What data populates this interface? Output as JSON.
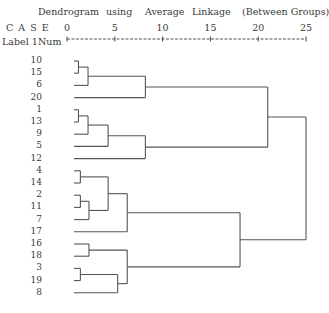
{
  "header": {
    "title_words": [
      "Dendrogram",
      "using",
      "Average",
      "Linkage",
      "(Between Groups)"
    ],
    "case_label": "C A S E",
    "label_col": "Label",
    "num_col": "Num"
  },
  "chart_data": {
    "type": "dendrogram",
    "xlabel": "Rescaled Distance Cluster Combine",
    "axis_ticks": [
      0,
      5,
      10,
      15,
      20,
      25
    ],
    "xlim": [
      0,
      25
    ],
    "leaf_order": [
      "10",
      "15",
      "6",
      "20",
      "1",
      "13",
      "9",
      "5",
      "12",
      "4",
      "14",
      "2",
      "11",
      "7",
      "17",
      "16",
      "18",
      "3",
      "19",
      "8"
    ],
    "merges": [
      {
        "id": "A",
        "children": [
          "10",
          "15"
        ],
        "distance": 1.2
      },
      {
        "id": "B",
        "children": [
          "A",
          "6"
        ],
        "distance": 2.2
      },
      {
        "id": "C",
        "children": [
          "B",
          "20"
        ],
        "distance": 8.2
      },
      {
        "id": "D",
        "children": [
          "1",
          "13"
        ],
        "distance": 1.2
      },
      {
        "id": "E",
        "children": [
          "D",
          "9"
        ],
        "distance": 2.2
      },
      {
        "id": "F",
        "children": [
          "E",
          "5"
        ],
        "distance": 4.3
      },
      {
        "id": "G",
        "children": [
          "F",
          "12"
        ],
        "distance": 8.2
      },
      {
        "id": "H",
        "children": [
          "C",
          "G"
        ],
        "distance": 21.0
      },
      {
        "id": "I",
        "children": [
          "4",
          "14"
        ],
        "distance": 1.4
      },
      {
        "id": "J",
        "children": [
          "2",
          "11"
        ],
        "distance": 1.4
      },
      {
        "id": "K",
        "children": [
          "J",
          "7"
        ],
        "distance": 2.3
      },
      {
        "id": "L",
        "children": [
          "I",
          "K"
        ],
        "distance": 4.3
      },
      {
        "id": "M",
        "children": [
          "L",
          "17"
        ],
        "distance": 6.3
      },
      {
        "id": "N",
        "children": [
          "16",
          "18"
        ],
        "distance": 2.3
      },
      {
        "id": "O",
        "children": [
          "3",
          "19"
        ],
        "distance": 1.4
      },
      {
        "id": "P",
        "children": [
          "O",
          "8"
        ],
        "distance": 5.3
      },
      {
        "id": "Q",
        "children": [
          "N",
          "P"
        ],
        "distance": 6.3
      },
      {
        "id": "R",
        "children": [
          "M",
          "Q"
        ],
        "distance": 18.1
      },
      {
        "id": "S",
        "children": [
          "H",
          "R"
        ],
        "distance": 25.0
      }
    ],
    "line_color": "#555555",
    "grid": false
  }
}
